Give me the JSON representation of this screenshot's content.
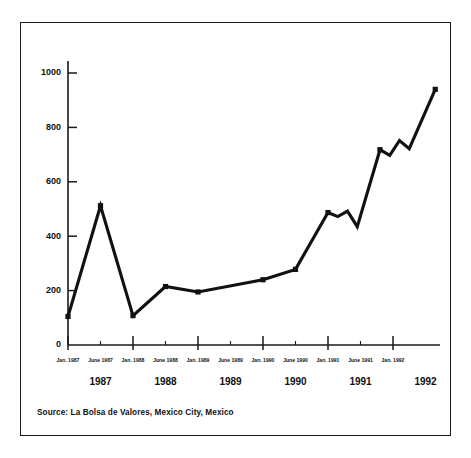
{
  "figure": {
    "source_note": "Source: La Bolsa de Valores, Mexico City, Mexico"
  },
  "chart_data": {
    "type": "line",
    "title": "",
    "subtitle": "",
    "xlabel": "",
    "ylabel": "",
    "grid": false,
    "legend": null,
    "ylim": [
      0,
      1060
    ],
    "yticks": [
      0,
      200,
      400,
      600,
      800,
      1000
    ],
    "ytick_labels": [
      "0",
      "200",
      "400",
      "600",
      "800",
      "1000"
    ],
    "x": [
      "Jan. 1987",
      "June 1987",
      "Jan. 1988",
      "June 1988",
      "Jan. 1989",
      "June 1989",
      "Jan. 1990",
      "June 1990",
      "Jan. 1991",
      "June 1991",
      "Jan. 1992"
    ],
    "xtick_labels": [
      "Jan. 1987",
      "June 1987",
      "Jan. 1988",
      "June 1988",
      "Jan. 1989",
      "June 1989",
      "Jan. 1990",
      "June 1990",
      "Jan. 1991",
      "June 1991",
      "Jan. 1992"
    ],
    "xtick_kinds": [
      "major",
      "minor",
      "major",
      "minor",
      "major",
      "minor",
      "major",
      "minor",
      "major",
      "minor",
      "major"
    ],
    "year_labels": [
      "1987",
      "1988",
      "1989",
      "1990",
      "1991",
      "1992"
    ],
    "series": [
      {
        "name": "Bolsa index",
        "color": "#111111",
        "marker": "square",
        "points": [
          {
            "x": 0.0,
            "label": "Jan. 1987",
            "y": 105
          },
          {
            "x": 1.0,
            "label": "June 1987",
            "y": 512
          },
          {
            "x": 2.0,
            "label": "Jan. 1988",
            "y": 108
          },
          {
            "x": 3.0,
            "label": "June 1988",
            "y": 215
          },
          {
            "x": 4.0,
            "label": "Jan. 1989",
            "y": 195
          },
          {
            "x": 6.0,
            "label": "Jan. 1990",
            "y": 240
          },
          {
            "x": 7.0,
            "label": "June 1990",
            "y": 278
          },
          {
            "x": 8.0,
            "label": "Jan. 1991",
            "y": 487
          },
          {
            "x": 8.3,
            "label": "",
            "y": 472
          },
          {
            "x": 8.6,
            "label": "",
            "y": 492
          },
          {
            "x": 8.9,
            "label": "",
            "y": 435
          },
          {
            "x": 9.6,
            "label": "June 1991",
            "y": 718
          },
          {
            "x": 9.9,
            "label": "",
            "y": 697
          },
          {
            "x": 10.2,
            "label": "",
            "y": 752
          },
          {
            "x": 10.5,
            "label": "",
            "y": 722
          },
          {
            "x": 11.3,
            "label": "Jan. 1992",
            "y": 940
          }
        ]
      }
    ]
  },
  "axis_geometry": {
    "x_origin_px": 68,
    "y_zero_px": 345,
    "y_top_px": 73,
    "y_top_value": 1000,
    "x_step_px": 32.5,
    "x_axis_end_px": 440
  }
}
